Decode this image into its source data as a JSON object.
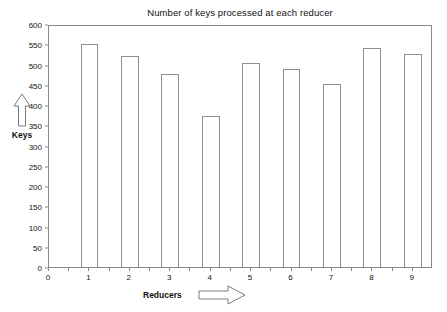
{
  "chart_data": {
    "type": "bar",
    "title": "Number of keys processed at each reducer",
    "xlabel": "Reducers",
    "ylabel": "Keys",
    "categories": [
      "1",
      "2",
      "3",
      "4",
      "5",
      "6",
      "7",
      "8",
      "9"
    ],
    "values": [
      550,
      522,
      477,
      372,
      504,
      488,
      453,
      542,
      525
    ],
    "xlim": [
      0,
      9.5
    ],
    "ylim": [
      0,
      600
    ],
    "ytick_labels": [
      "0",
      "50",
      "100",
      "150",
      "200",
      "250",
      "300",
      "350",
      "400",
      "450",
      "500",
      "550",
      "600"
    ],
    "ytick_values": [
      0,
      50,
      100,
      150,
      200,
      250,
      300,
      350,
      400,
      450,
      500,
      550,
      600
    ],
    "xtick_labels": [
      "0",
      "1",
      "2",
      "3",
      "4",
      "5",
      "6",
      "7",
      "8",
      "9"
    ],
    "xtick_values": [
      0,
      1,
      2,
      3,
      4,
      5,
      6,
      7,
      8,
      9
    ],
    "grid": false,
    "legend": false,
    "bar_fill_color": "#ffffff",
    "bar_edge_color": "#8f8f8f",
    "axis_color": "#8a8a8a",
    "text_color": "#111111",
    "background_color": "#ffffff"
  },
  "axis_decorations": {
    "y_arrow_icon": "up-arrow-icon",
    "x_arrow_icon": "right-arrow-icon"
  }
}
